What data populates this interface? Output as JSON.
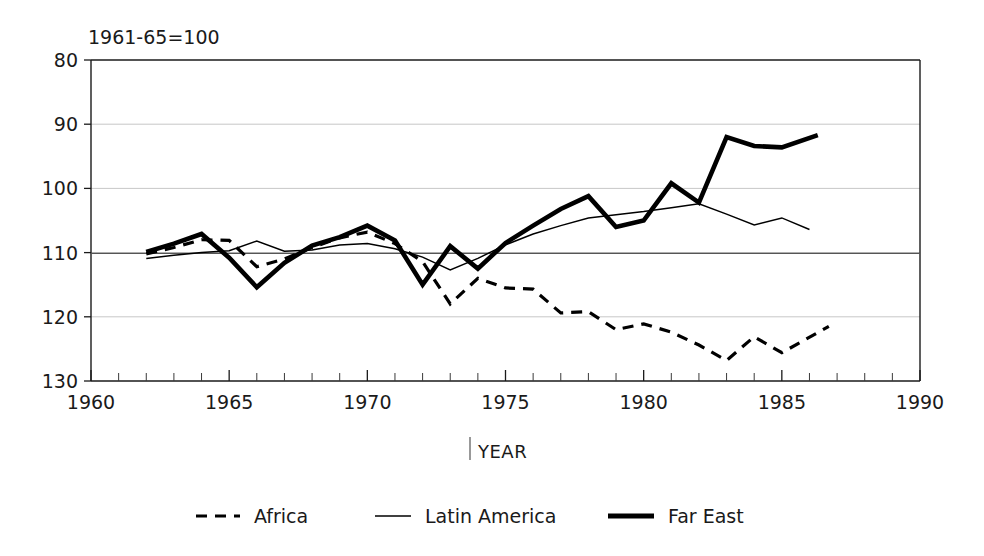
{
  "chart_data": {
    "type": "line",
    "title": "",
    "note": "1961-65=100",
    "xlabel": "YEAR",
    "ylabel": "",
    "xlim": [
      1960,
      1990
    ],
    "ylim": [
      80,
      130
    ],
    "yticks": [
      80,
      90,
      100,
      110,
      120,
      130
    ],
    "xticks": [
      1960,
      1965,
      1970,
      1975,
      1980,
      1985,
      1990
    ],
    "xtick_minor_step": 1,
    "grid": true,
    "reference_line": 100,
    "legend_position": "bottom",
    "series": [
      {
        "name": "Africa",
        "style": "dashed",
        "x": [
          1962,
          1963,
          1964,
          1965,
          1966,
          1967,
          1968,
          1969,
          1970,
          1971,
          1972,
          1973,
          1974,
          1975,
          1976,
          1977,
          1978,
          1979,
          1980,
          1981,
          1982,
          1983,
          1984,
          1985,
          1986.7
        ],
        "values": [
          99.8,
          100.8,
          102.0,
          101.9,
          97.8,
          99.0,
          100.8,
          102.3,
          103.2,
          101.4,
          98.6,
          92.0,
          96.0,
          94.5,
          94.3,
          90.6,
          90.8,
          88.0,
          88.9,
          87.6,
          85.6,
          83.2,
          86.9,
          84.4,
          88.5
        ]
      },
      {
        "name": "Latin America",
        "style": "solid-thin",
        "x": [
          1962,
          1963,
          1964,
          1965,
          1966,
          1967,
          1968,
          1969,
          1970,
          1971,
          1972,
          1973,
          1974,
          1975,
          1976,
          1977,
          1978,
          1979,
          1980,
          1981,
          1982,
          1983,
          1984,
          1985,
          1986
        ],
        "values": [
          99.1,
          99.6,
          100.0,
          100.3,
          101.8,
          100.2,
          100.4,
          101.2,
          101.4,
          100.6,
          99.3,
          97.3,
          99.1,
          101.2,
          102.9,
          104.2,
          105.4,
          105.9,
          106.4,
          107.0,
          107.6,
          106.0,
          104.3,
          105.4,
          103.6
        ]
      },
      {
        "name": "Far East",
        "style": "solid-thick",
        "x": [
          1962,
          1963,
          1964,
          1965,
          1966,
          1967,
          1968,
          1969,
          1970,
          1971,
          1972,
          1973,
          1974,
          1975,
          1976,
          1977,
          1978,
          1979,
          1980,
          1981,
          1982,
          1983,
          1984,
          1985,
          1986.3
        ],
        "values": [
          100.1,
          101.4,
          102.9,
          99.2,
          94.6,
          98.4,
          101.1,
          102.4,
          104.2,
          101.9,
          95.0,
          101.0,
          97.5,
          101.5,
          104.2,
          106.8,
          108.8,
          104.0,
          105.0,
          110.8,
          107.8,
          118.0,
          116.6,
          116.4,
          118.3
        ]
      }
    ]
  },
  "axis": {
    "y_labels": [
      "130",
      "120",
      "110",
      "100",
      "90",
      "80"
    ],
    "x_labels": [
      "1960",
      "1965",
      "1970",
      "1975",
      "1980",
      "1985",
      "1990"
    ],
    "x_title": "YEAR",
    "note": "1961-65=100"
  },
  "legend": {
    "items": [
      {
        "label": "Africa",
        "icon": "dashed-line-icon"
      },
      {
        "label": "Latin America",
        "icon": "thin-line-icon"
      },
      {
        "label": "Far East",
        "icon": "thick-line-icon"
      }
    ]
  }
}
